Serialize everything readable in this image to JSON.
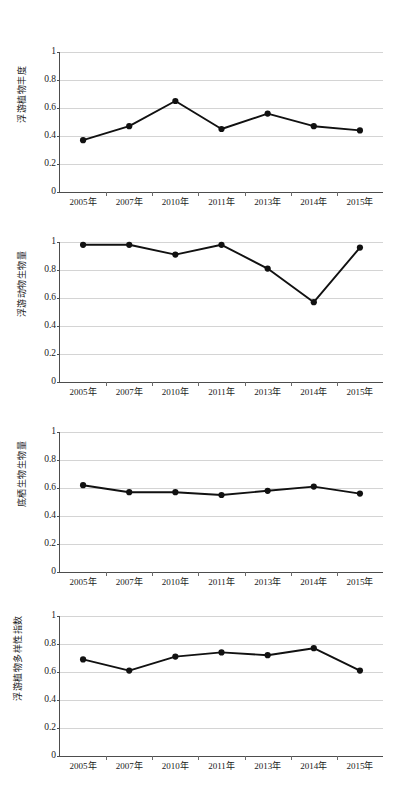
{
  "page": {
    "background": "#ffffff",
    "width": 399,
    "height": 788
  },
  "style": {
    "line_color": "#111111",
    "grid_color": "#d4d4d4",
    "axis_color": "#4d4d4d",
    "text_color": "#1a1a1a"
  },
  "charts": [
    {
      "id": "chart-phytoplankton-abundance",
      "ylabel": "浮游植物丰度",
      "ytick_labels": [
        "0",
        "0.2",
        "0.4",
        "0.6",
        "0.8",
        "1"
      ],
      "xtick_labels": [
        "2005年",
        "2007年",
        "2010年",
        "2011年",
        "2013年",
        "2014年",
        "2015年"
      ]
    },
    {
      "id": "chart-zooplankton-biomass",
      "ylabel": "浮游动物生物量",
      "ytick_labels": [
        "0",
        "0.2",
        "0.4",
        "0.6",
        "0.8",
        "1"
      ],
      "xtick_labels": [
        "2005年",
        "2007年",
        "2010年",
        "2011年",
        "2013年",
        "2014年",
        "2015年"
      ]
    },
    {
      "id": "chart-benthos-biomass",
      "ylabel": "底栖生物生物量",
      "ytick_labels": [
        "0",
        "0.2",
        "0.4",
        "0.6",
        "0.8",
        "1"
      ],
      "xtick_labels": [
        "2005年",
        "2007年",
        "2010年",
        "2011年",
        "2013年",
        "2014年",
        "2015年"
      ]
    },
    {
      "id": "chart-phytoplankton-diversity-index",
      "ylabel": "浮游植物多样性指数",
      "ytick_labels": [
        "0",
        "0.2",
        "0.4",
        "0.6",
        "0.8",
        "1"
      ],
      "xtick_labels": [
        "2005年",
        "2007年",
        "2010年",
        "2011年",
        "2013年",
        "2014年",
        "2015年"
      ]
    }
  ],
  "chart_data": [
    {
      "type": "line",
      "title": "",
      "xlabel": "",
      "ylabel": "浮游植物丰度",
      "categories": [
        "2005年",
        "2007年",
        "2010年",
        "2011年",
        "2013年",
        "2014年",
        "2015年"
      ],
      "values": [
        0.37,
        0.47,
        0.65,
        0.45,
        0.56,
        0.47,
        0.44
      ],
      "ylim": [
        0,
        1
      ],
      "yticks": [
        0,
        0.2,
        0.4,
        0.6,
        0.8,
        1
      ],
      "grid": true,
      "legend": "none",
      "markers": true
    },
    {
      "type": "line",
      "title": "",
      "xlabel": "",
      "ylabel": "浮游动物生物量",
      "categories": [
        "2005年",
        "2007年",
        "2010年",
        "2011年",
        "2013年",
        "2014年",
        "2015年"
      ],
      "values": [
        0.98,
        0.98,
        0.91,
        0.98,
        0.81,
        0.57,
        0.96
      ],
      "ylim": [
        0,
        1
      ],
      "yticks": [
        0,
        0.2,
        0.4,
        0.6,
        0.8,
        1
      ],
      "grid": true,
      "legend": "none",
      "markers": true
    },
    {
      "type": "line",
      "title": "",
      "xlabel": "",
      "ylabel": "底栖生物生物量",
      "categories": [
        "2005年",
        "2007年",
        "2010年",
        "2011年",
        "2013年",
        "2014年",
        "2015年"
      ],
      "values": [
        0.62,
        0.57,
        0.57,
        0.55,
        0.58,
        0.61,
        0.56
      ],
      "ylim": [
        0,
        1
      ],
      "yticks": [
        0,
        0.2,
        0.4,
        0.6,
        0.8,
        1
      ],
      "grid": true,
      "legend": "none",
      "markers": true
    },
    {
      "type": "line",
      "title": "",
      "xlabel": "",
      "ylabel": "浮游植物多样性指数",
      "categories": [
        "2005年",
        "2007年",
        "2010年",
        "2011年",
        "2013年",
        "2014年",
        "2015年"
      ],
      "values": [
        0.69,
        0.61,
        0.71,
        0.74,
        0.72,
        0.77,
        0.61
      ],
      "ylim": [
        0,
        1
      ],
      "yticks": [
        0,
        0.2,
        0.4,
        0.6,
        0.8,
        1
      ],
      "grid": true,
      "legend": "none",
      "markers": true
    }
  ]
}
